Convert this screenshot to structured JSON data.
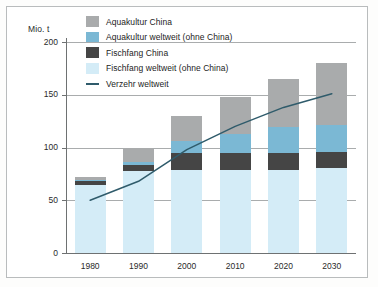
{
  "axis": {
    "unit_label": "Mio. t",
    "y_ticks": [
      "200",
      "150",
      "100",
      "50",
      "0"
    ],
    "y_tick_values": [
      200,
      150,
      100,
      50,
      0
    ],
    "x_ticks": [
      "1980",
      "1990",
      "2000",
      "2010",
      "2020",
      "2030"
    ]
  },
  "legend": {
    "items": [
      {
        "label": "Aquakultur China",
        "color": "#a9abac",
        "type": "swatch"
      },
      {
        "label": "Aquakultur weltweit (ohne China)",
        "color": "#7bb8d4",
        "type": "swatch"
      },
      {
        "label": "Fischfang China",
        "color": "#454545",
        "type": "swatch"
      },
      {
        "label": "Fischfang weltweit (ohne China)",
        "color": "#d4ecf7",
        "type": "swatch"
      },
      {
        "label": "Verzehr weltweit",
        "color": "#2f5b6b",
        "type": "line"
      }
    ]
  },
  "chart_data": {
    "type": "bar",
    "title": "",
    "xlabel": "",
    "ylabel": "Mio. t",
    "ylim": [
      0,
      200
    ],
    "grid": true,
    "legend_position": "top-left",
    "stacked": true,
    "categories": [
      "1980",
      "1990",
      "2000",
      "2010",
      "2020",
      "2030"
    ],
    "series": [
      {
        "name": "Fischfang weltweit (ohne China)",
        "color": "#d4ecf7",
        "values": [
          64,
          78,
          79,
          79,
          79,
          81
        ]
      },
      {
        "name": "Fischfang China",
        "color": "#454545",
        "values": [
          4,
          5,
          16,
          16,
          16,
          15
        ]
      },
      {
        "name": "Aquakultur weltweit (ohne China)",
        "color": "#7bb8d4",
        "values": [
          1,
          3,
          11,
          18,
          24,
          25
        ]
      },
      {
        "name": "Aquakultur China",
        "color": "#a9abac",
        "values": [
          3,
          14,
          24,
          35,
          46,
          59
        ]
      }
    ],
    "totals": [
      72,
      100,
      130,
      148,
      165,
      180
    ],
    "line_series": {
      "name": "Verzehr weltweit",
      "color": "#2f5b6b",
      "values": [
        50,
        68,
        98,
        120,
        138,
        151
      ]
    }
  }
}
